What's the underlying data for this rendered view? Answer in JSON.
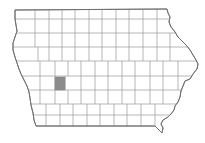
{
  "map": {
    "title": "Iowa counties",
    "region": "Iowa",
    "highlighted_county": "Audubon County",
    "colors": {
      "background": "#ffffff",
      "county_fill": "#ffffff",
      "county_border": "#9a9a9a",
      "state_border": "#6e6e6e",
      "highlight_fill": "#8c8c8c"
    }
  }
}
